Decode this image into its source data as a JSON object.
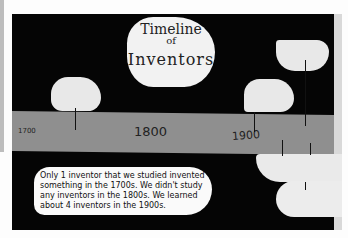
{
  "title_card": {
    "line1": "Timeline",
    "line2": "of",
    "line3": "Inventors"
  },
  "timeline": {
    "labels": [
      "1700",
      "1800",
      "1900"
    ]
  },
  "summary_note": {
    "text": "Only 1 inventor that we studied invented something in the 1700s. We didn't study any inventors in the 1800s. We learned about 4 inventors in the 1900s."
  },
  "colors": {
    "board": "#050505",
    "band": "#8f8f8f",
    "paper": "#f2f2f2"
  }
}
